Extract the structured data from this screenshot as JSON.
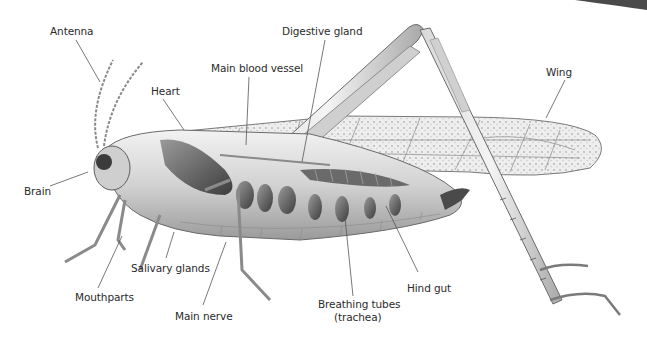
{
  "diagram": {
    "colors": {
      "background": "#ffffff",
      "label_text": "#2a2a2a",
      "leader_line": "#555555",
      "body_light": "#e6e6e6",
      "body_mid": "#b8b8b8",
      "body_dark": "#5a5a5a",
      "wing_fill": "#ececec",
      "wing_vein": "#8a8a8a"
    },
    "labels": [
      {
        "id": "antenna",
        "text": "Antenna",
        "x": 50,
        "y": 25
      },
      {
        "id": "digestive-gland",
        "text": "Digestive gland",
        "x": 282,
        "y": 25
      },
      {
        "id": "main-blood-vessel",
        "text": "Main blood vessel",
        "x": 211,
        "y": 62
      },
      {
        "id": "heart",
        "text": "Heart",
        "x": 151,
        "y": 85
      },
      {
        "id": "wing",
        "text": "Wing",
        "x": 546,
        "y": 66
      },
      {
        "id": "brain",
        "text": "Brain",
        "x": 24,
        "y": 185
      },
      {
        "id": "salivary-glands",
        "text": "Salivary glands",
        "x": 131,
        "y": 262
      },
      {
        "id": "mouthparts",
        "text": "Mouthparts",
        "x": 75,
        "y": 291
      },
      {
        "id": "main-nerve",
        "text": "Main nerve",
        "x": 175,
        "y": 310
      },
      {
        "id": "hind-gut",
        "text": "Hind gut",
        "x": 407,
        "y": 282
      },
      {
        "id": "breathing-tubes",
        "text": "Breathing tubes",
        "x": 318,
        "y": 298
      },
      {
        "id": "breathing-tubes-sub",
        "text": "(trachea)",
        "x": 334,
        "y": 311
      }
    ]
  }
}
